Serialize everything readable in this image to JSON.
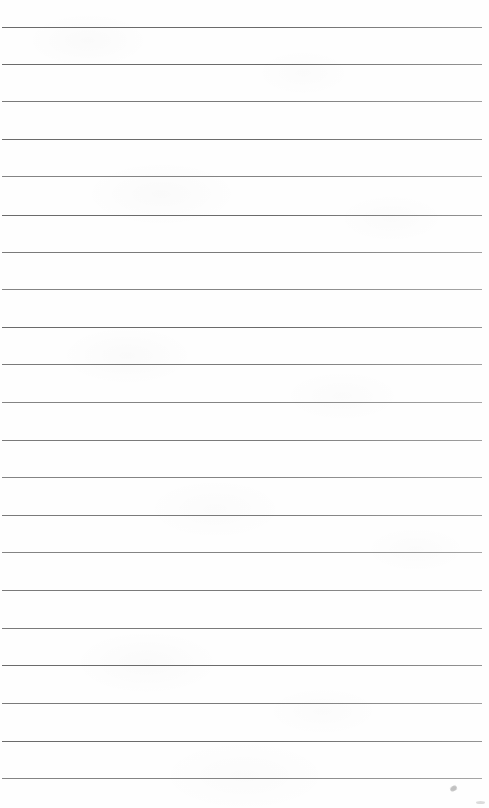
{
  "document": {
    "kind": "scanned-lined-paper",
    "title": "Blank Ruled Notebook Page",
    "page_width": 489,
    "page_height": 808,
    "background_color": "#fefefe",
    "has_text_content": false,
    "text_content": "",
    "header_text": "",
    "footer_text": "",
    "page_number_text": ""
  },
  "ruling": {
    "line_color": "#6a6a6a",
    "line_thickness_px": 1.5,
    "line_count": 21,
    "first_line_y": 27,
    "line_spacing_px": 37.3,
    "line_left_x": 2,
    "line_right_x": 482,
    "has_vertical_margin_rule": false,
    "margin_rule_color": "",
    "lines": [
      {
        "index": 1,
        "y": 27,
        "left": 2,
        "right": 482,
        "tone": "tone-a"
      },
      {
        "index": 2,
        "y": 64,
        "left": 2,
        "right": 482,
        "tone": "tone-a"
      },
      {
        "index": 3,
        "y": 101,
        "left": 2,
        "right": 482,
        "tone": "tone-b"
      },
      {
        "index": 4,
        "y": 139,
        "left": 2,
        "right": 482,
        "tone": "tone-a"
      },
      {
        "index": 5,
        "y": 176,
        "left": 2,
        "right": 482,
        "tone": "tone-c"
      },
      {
        "index": 6,
        "y": 215,
        "left": 2,
        "right": 482,
        "tone": "tone-a"
      },
      {
        "index": 7,
        "y": 252,
        "left": 2,
        "right": 482,
        "tone": "tone-b"
      },
      {
        "index": 8,
        "y": 289,
        "left": 2,
        "right": 482,
        "tone": "tone-c"
      },
      {
        "index": 9,
        "y": 327,
        "left": 2,
        "right": 482,
        "tone": "tone-a"
      },
      {
        "index": 10,
        "y": 364,
        "left": 2,
        "right": 482,
        "tone": "tone-b"
      },
      {
        "index": 11,
        "y": 402,
        "left": 2,
        "right": 482,
        "tone": "tone-c"
      },
      {
        "index": 12,
        "y": 440,
        "left": 2,
        "right": 482,
        "tone": "tone-b"
      },
      {
        "index": 13,
        "y": 477,
        "left": 2,
        "right": 482,
        "tone": "tone-c"
      },
      {
        "index": 14,
        "y": 515,
        "left": 2,
        "right": 482,
        "tone": "tone-b"
      },
      {
        "index": 15,
        "y": 552,
        "left": 2,
        "right": 482,
        "tone": "tone-c"
      },
      {
        "index": 16,
        "y": 590,
        "left": 2,
        "right": 482,
        "tone": "tone-b"
      },
      {
        "index": 17,
        "y": 628,
        "left": 2,
        "right": 482,
        "tone": "tone-b"
      },
      {
        "index": 18,
        "y": 665,
        "left": 2,
        "right": 482,
        "tone": "tone-a"
      },
      {
        "index": 19,
        "y": 703,
        "left": 2,
        "right": 482,
        "tone": "tone-b"
      },
      {
        "index": 20,
        "y": 741,
        "left": 2,
        "right": 482,
        "tone": "tone-a"
      },
      {
        "index": 21,
        "y": 778,
        "left": 2,
        "right": 482,
        "tone": "tone-c"
      }
    ]
  },
  "artifacts": {
    "pencil_smudge": {
      "x": 450,
      "y": 786,
      "label": "faint pencil smudge"
    },
    "edge_speck": {
      "x": 476,
      "y": 801,
      "label": "faint scan speck"
    },
    "paper_texture_label": "faint paper mottling"
  }
}
